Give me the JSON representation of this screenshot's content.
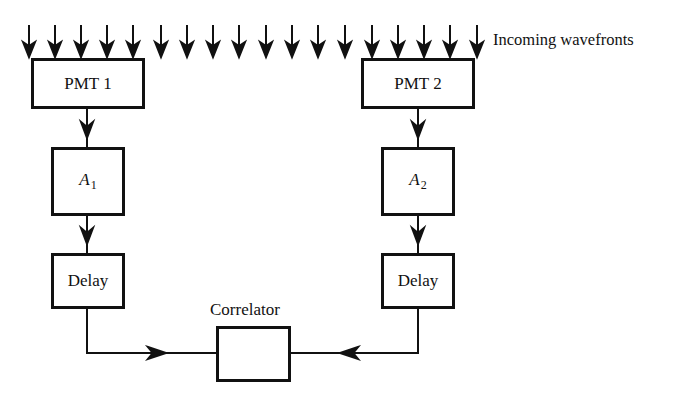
{
  "diagram": {
    "wavefront_label": "Incoming wavefronts",
    "wavefront_arrow_count": 18,
    "blocks": {
      "pmt1": "PMT 1",
      "pmt2": "PMT 2",
      "amp1": {
        "base": "A",
        "sub": "1"
      },
      "amp2": {
        "base": "A",
        "sub": "2"
      },
      "delay1": "Delay",
      "delay2": "Delay",
      "correlator": ""
    },
    "correlator_label": "Correlator",
    "colors": {
      "line": "#111111",
      "background": "#ffffff"
    }
  }
}
